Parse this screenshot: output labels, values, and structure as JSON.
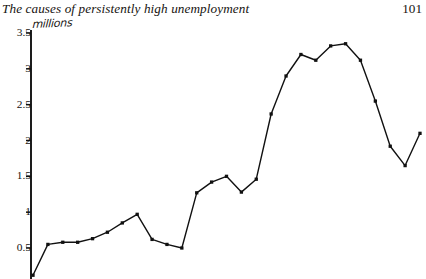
{
  "header": {
    "title": "The causes of persistently high unemployment",
    "page_number": "101"
  },
  "chart_data": {
    "type": "line",
    "title": "",
    "subtitle": "",
    "xlabel": "",
    "ylabel": "millions",
    "units_label": "millions",
    "ylim": [
      0,
      3.5
    ],
    "xlim": [
      0,
      26
    ],
    "grid": false,
    "legend": false,
    "legend_position": "none",
    "marker": "square",
    "marker_color": "#111111",
    "line_color": "#111111",
    "axis_color": "#111111",
    "y_ticks": [
      0.5,
      1,
      1.5,
      2,
      2.5,
      3,
      3.5
    ],
    "y_tick_labels": [
      "0.5",
      "1",
      "1.5",
      "2",
      "2.5",
      "3",
      "3.5"
    ],
    "x_ticks": [],
    "x_tick_labels": [],
    "series": [
      {
        "name": "Unemployment",
        "values": [
          0.12,
          0.55,
          0.58,
          0.58,
          0.63,
          0.72,
          0.85,
          0.97,
          0.62,
          0.55,
          0.5,
          1.27,
          1.42,
          1.5,
          1.28,
          1.46,
          2.37,
          2.9,
          3.2,
          3.12,
          3.32,
          3.35,
          3.12,
          2.55,
          1.92,
          1.65,
          2.1
        ]
      }
    ],
    "x": [
      0,
      1,
      2,
      3,
      4,
      5,
      6,
      7,
      8,
      9,
      10,
      11,
      12,
      13,
      14,
      15,
      16,
      17,
      18,
      19,
      20,
      21,
      22,
      23,
      24,
      25,
      26
    ]
  }
}
